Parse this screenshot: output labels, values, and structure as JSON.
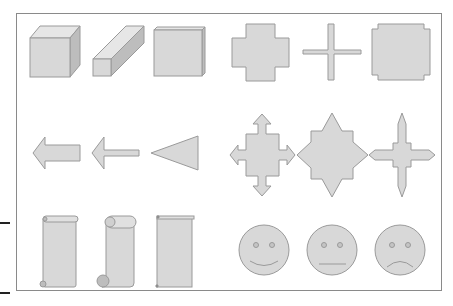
{
  "figure": {
    "fill_color": "#d8d8d8",
    "top_color": "#e6e6e6",
    "side_color": "#bdbdbd",
    "stroke_color": "#9a9a9a",
    "frame_color": "#8a8a8a",
    "rows": [
      {
        "name": "row-1",
        "shapes": [
          "cube",
          "bar-3d",
          "bevel",
          "plus",
          "thin-cross",
          "plaque"
        ]
      },
      {
        "name": "row-2",
        "shapes": [
          "left-arrow-wide",
          "left-arrow-thin",
          "left-triangle",
          "quad-arrow",
          "eight-point-star",
          "four-point-star"
        ]
      },
      {
        "name": "row-3",
        "shapes": [
          "vertical-scroll",
          "vertical-scroll-curled",
          "vertical-scroll-flat",
          "smiley-happy",
          "smiley-neutral",
          "smiley-sad"
        ]
      }
    ]
  }
}
